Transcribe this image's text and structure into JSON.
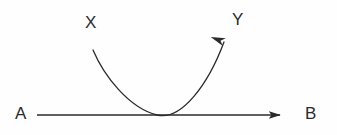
{
  "figure": {
    "kind": "geometry-diagram",
    "width": 337,
    "height": 135,
    "background_color": "#fefefe",
    "stroke_color": "#2a2a2a",
    "label_color": "#2b2b2b"
  },
  "labels": {
    "a": "A",
    "b": "B",
    "x": "X",
    "y": "Y"
  },
  "elements": {
    "baseline": {
      "name": "line A to B",
      "from_label": "A",
      "to_label": "B",
      "start": [
        37,
        115
      ],
      "end": [
        291,
        115
      ],
      "arrowhead": "end",
      "arrow_style": "solid-filled-triangle",
      "stroke_width": 1.5
    },
    "curve": {
      "name": "curve X to Y",
      "from_label": "X",
      "to_label": "Y",
      "start": [
        93,
        50
      ],
      "tangent_point": [
        157,
        115
      ],
      "end": [
        228,
        31
      ],
      "arrowhead": "end",
      "arrow_style": "narrow-barbed",
      "stroke_width": 1.3,
      "shape": "parabola tangent to line AB"
    }
  }
}
